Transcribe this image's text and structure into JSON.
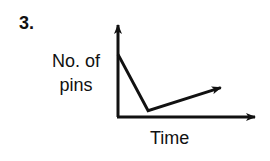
{
  "question": {
    "number_label": "3."
  },
  "chart_data": {
    "type": "line",
    "title": "",
    "xlabel": "Time",
    "ylabel": "No. of pins",
    "ylabel_lines": [
      "No. of",
      "pins"
    ],
    "x_ticks": [],
    "y_ticks": [],
    "grid": false,
    "legend": null,
    "series": [
      {
        "name": "No. of pins",
        "description": "Starts high, drops steeply to a minimum, then rises gradually; arrowhead indicates continued increase",
        "x": [
          0,
          0.22,
          0.75
        ],
        "y": [
          0.68,
          0.07,
          0.32
        ],
        "ends_with_arrow": true
      }
    ],
    "axes": {
      "x_axis_arrow": true,
      "y_axis_arrow": true,
      "xlim": [
        0,
        1
      ],
      "ylim": [
        0,
        1
      ]
    },
    "colors": {
      "line": "#111111",
      "background": "#ffffff"
    }
  }
}
